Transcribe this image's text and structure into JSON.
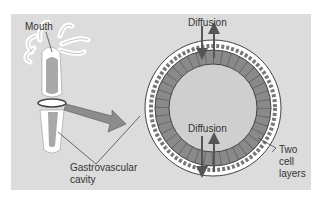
{
  "diagram": {
    "labels": {
      "mouth": "Mouth",
      "diffusion_top": "Diffusion",
      "diffusion_inner": "Diffusion",
      "gastro_line1": "Gastrovascular",
      "gastro_line2": "cavity",
      "two_line1": "Two",
      "two_line2": "cell",
      "two_line3": "layers"
    },
    "colors": {
      "background": "#dcdcdc",
      "ectoderm": "#ffffff",
      "endoderm": "#8a8a8a",
      "cavity": "#c9c9c9",
      "arrow": "#666666"
    }
  }
}
